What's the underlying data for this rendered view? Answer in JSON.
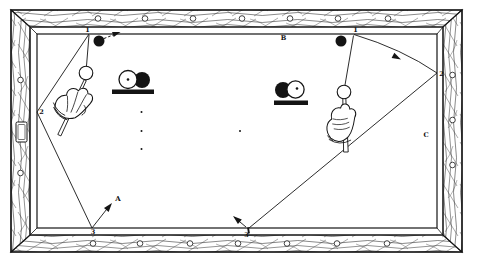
{
  "figure": {
    "colors": {
      "ink": "#141414",
      "paper": "#ffffff"
    },
    "shot_left": {
      "point1": "1",
      "point2": "2",
      "point3": "3",
      "target": "A"
    },
    "shot_right": {
      "title": "B",
      "point1": "1",
      "point2": "2",
      "point3": "3",
      "side_label": "C"
    },
    "icons": {
      "left_inset": "ball-contact-inset (white cue ball frozen to black ball on shelf)",
      "right_inset": "ball-contact-inset (black ball behind white cue ball on shelf)",
      "hands": "bridge-hand holding cue stick"
    }
  }
}
